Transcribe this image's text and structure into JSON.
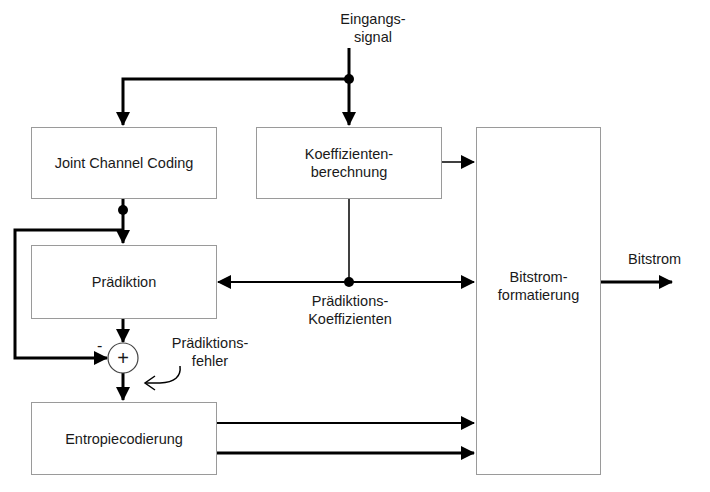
{
  "diagram": {
    "input_label": "Eingangs-\nsignal",
    "output_label": "Bitstrom",
    "blocks": {
      "joint_channel_coding": "Joint Channel Coding",
      "koeffizienten": "Koeffizienten-\nberechnung",
      "praediktion": "Prädiktion",
      "entropiecodierung": "Entropiecodierung",
      "bitstrom": "Bitstrom-\nformatierung"
    },
    "annotations": {
      "praediktions_koeffizienten": "Prädiktions-\nKoeffizienten",
      "praediktionsfehler": "Prädiktions-\nfehler",
      "minus_sign": "-",
      "sum_symbol": "+"
    },
    "colors": {
      "line": "#000000",
      "box_border": "#9a9a9a"
    }
  }
}
